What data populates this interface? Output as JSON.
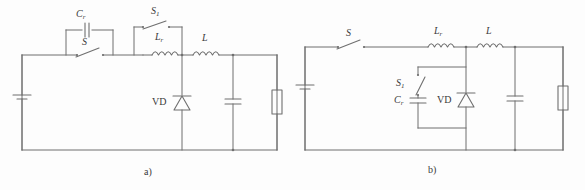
{
  "figure": {
    "type": "circuit-schematic",
    "panel_count": 2,
    "background_color": "#fdfdfd",
    "line_color": "#6f6f6f",
    "text_color": "#3a3a3a"
  },
  "panel_a": {
    "caption": "a)",
    "labels": {
      "resonant_capacitor": "C",
      "resonant_capacitor_sub": "r",
      "main_switch": "S",
      "aux_switch": "S",
      "aux_switch_sub": "1",
      "resonant_inductor": "L",
      "resonant_inductor_sub": "r",
      "filter_inductor": "L",
      "diode": "VD"
    },
    "components": [
      {
        "name": "dc-source",
        "type": "battery"
      },
      {
        "name": "main-switch-s",
        "type": "switch"
      },
      {
        "name": "resonant-capacitor-cr",
        "type": "capacitor"
      },
      {
        "name": "aux-switch-s1",
        "type": "switch"
      },
      {
        "name": "resonant-inductor-lr",
        "type": "inductor"
      },
      {
        "name": "filter-inductor-l",
        "type": "inductor"
      },
      {
        "name": "freewheel-diode-vd",
        "type": "diode"
      },
      {
        "name": "output-capacitor",
        "type": "capacitor"
      },
      {
        "name": "load-resistor",
        "type": "resistor"
      }
    ]
  },
  "panel_b": {
    "caption": "b)",
    "labels": {
      "main_switch": "S",
      "aux_switch": "S",
      "aux_switch_sub": "1",
      "resonant_capacitor": "C",
      "resonant_capacitor_sub": "r",
      "resonant_inductor": "L",
      "resonant_inductor_sub": "r",
      "filter_inductor": "L",
      "diode": "VD"
    },
    "components": [
      {
        "name": "dc-source",
        "type": "battery"
      },
      {
        "name": "main-switch-s",
        "type": "switch"
      },
      {
        "name": "resonant-inductor-lr",
        "type": "inductor"
      },
      {
        "name": "filter-inductor-l",
        "type": "inductor"
      },
      {
        "name": "aux-switch-s1",
        "type": "switch"
      },
      {
        "name": "resonant-capacitor-cr",
        "type": "capacitor"
      },
      {
        "name": "freewheel-diode-vd",
        "type": "diode"
      },
      {
        "name": "output-capacitor",
        "type": "capacitor"
      },
      {
        "name": "load-resistor",
        "type": "resistor"
      }
    ]
  }
}
